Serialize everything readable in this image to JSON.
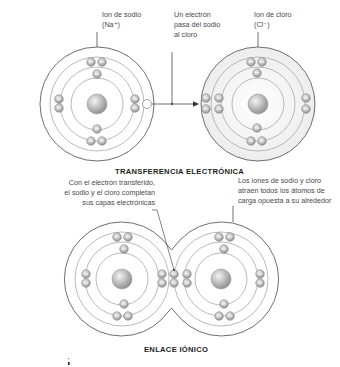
{
  "top_section": {
    "title": "TRANSFERENCIA ELECTRÓNICA",
    "sodium_label_line1": "Ion de sodio",
    "sodium_label_line2": "(Na⁺)",
    "transfer_label_line1": "Un electrón",
    "transfer_label_line2": "pasa del sodio",
    "transfer_label_line3": "al cloro",
    "chlorine_label_line1": "Ion de cloro",
    "chlorine_label_line2": "(Cl⁻)"
  },
  "bottom_section": {
    "title": "ENLACE IÓNICO",
    "left_note_line1": "Con el electrón transferido,",
    "left_note_line2": "el sodio y el cloro completan",
    "left_note_line3": "sus capas electrónicas",
    "right_note_line1": "Los iones de sodio y cloro",
    "right_note_line2": "atraen todos los átomos de",
    "right_note_line3": "carga opuesta a su alrededor"
  },
  "colors": {
    "ring": "#9a9a9a",
    "outer_ring": "#6e6e6e",
    "electron_fill": "#b8b8b8",
    "nucleus_fill": "#b5b5b5",
    "cl_fill": "#f2f2f2",
    "text": "#4a4a4a",
    "title": "#1e1e1e"
  }
}
